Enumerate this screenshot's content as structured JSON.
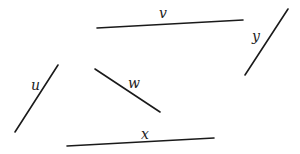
{
  "diagram": {
    "segments": [
      {
        "name": "v",
        "x1": 97,
        "y1": 28,
        "x2": 243,
        "y2": 20
      },
      {
        "name": "y",
        "x1": 245,
        "y1": 75,
        "x2": 288,
        "y2": 9
      },
      {
        "name": "u",
        "x1": 15,
        "y1": 132,
        "x2": 58,
        "y2": 65
      },
      {
        "name": "w",
        "x1": 95,
        "y1": 69,
        "x2": 160,
        "y2": 112
      },
      {
        "name": "x",
        "x1": 67,
        "y1": 146,
        "x2": 214,
        "y2": 138
      }
    ],
    "labels": {
      "v": "v",
      "y": "y",
      "u": "u",
      "w": "w",
      "x": "x"
    }
  }
}
